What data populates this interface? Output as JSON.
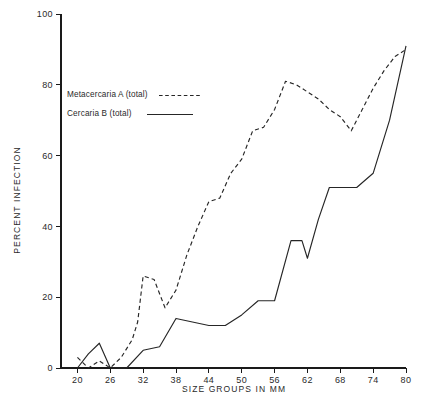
{
  "chart_data": {
    "type": "line",
    "title": "",
    "xlabel": "SIZE GROUPS IN MM",
    "ylabel": "PERCENT INFECTION",
    "xlim": [
      17,
      80
    ],
    "ylim": [
      0,
      100
    ],
    "xticks": [
      20,
      26,
      32,
      38,
      44,
      50,
      56,
      62,
      68,
      74,
      80
    ],
    "xtick_labels": [
      "20",
      "26",
      "32",
      "38",
      "44",
      "50",
      "56",
      "62",
      "68",
      "74",
      "80"
    ],
    "yticks": [
      0,
      20,
      40,
      60,
      80,
      100
    ],
    "ytick_labels": [
      "0",
      "20",
      "40",
      "60",
      "80",
      "100"
    ],
    "grid": false,
    "legend_position": "upper-left",
    "series": [
      {
        "name": "Metacercaria A (total)",
        "style": "dashed",
        "x": [
          20,
          22,
          24,
          26,
          28,
          30,
          31,
          32,
          34,
          36,
          38,
          40,
          42,
          44,
          46,
          48,
          50,
          52,
          54,
          56,
          58,
          60,
          62,
          64,
          66,
          68,
          70,
          72,
          74,
          76,
          78,
          80
        ],
        "y": [
          3,
          0,
          2,
          0,
          3,
          8,
          13,
          26,
          25,
          17,
          22,
          32,
          40,
          47,
          48,
          55,
          59,
          67,
          68,
          73,
          81,
          80,
          78,
          76,
          73,
          71,
          67,
          73,
          79,
          84,
          88,
          90
        ]
      },
      {
        "name": "Cercaria B (total)",
        "style": "solid",
        "x": [
          20,
          22,
          24,
          26,
          29,
          32,
          35,
          38,
          41,
          44,
          47,
          50,
          53,
          56,
          59,
          61,
          62,
          64,
          66,
          68,
          71,
          74,
          77,
          80
        ],
        "y": [
          0,
          4,
          7,
          0,
          0,
          5,
          6,
          14,
          13,
          12,
          12,
          15,
          19,
          19,
          36,
          36,
          31,
          42,
          51,
          51,
          51,
          55,
          70,
          91
        ]
      }
    ]
  },
  "legend": {
    "entries": [
      {
        "label": "Metacercaria A (total)",
        "style": "dashed"
      },
      {
        "label": "Cercaria B (total)",
        "style": "solid"
      }
    ]
  }
}
